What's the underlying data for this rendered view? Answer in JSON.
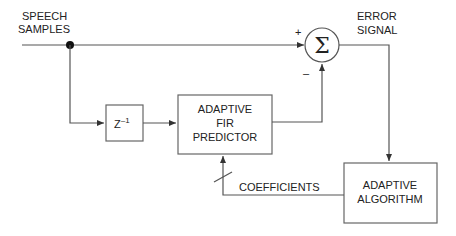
{
  "diagram": {
    "type": "block-diagram",
    "input_label": [
      "SPEECH",
      "SAMPLES"
    ],
    "output_label": [
      "ERROR",
      "SIGNAL"
    ],
    "summer": {
      "symbol": "Σ",
      "plus_sign": "+",
      "minus_sign": "–"
    },
    "delay_block": {
      "base": "Z",
      "exponent": "–1"
    },
    "predictor_block": {
      "lines": [
        "ADAPTIVE",
        "FIR",
        "PREDICTOR"
      ]
    },
    "algorithm_block": {
      "lines": [
        "ADAPTIVE",
        "ALGORITHM"
      ]
    },
    "coefficients_label": "COEFFICIENTS",
    "colors": {
      "line": "#555555",
      "text": "#222222",
      "background": "#ffffff"
    }
  }
}
